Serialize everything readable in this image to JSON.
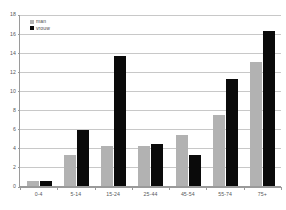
{
  "chart_data": {
    "type": "bar",
    "title": "",
    "subtitle": "",
    "xlabel": "",
    "ylabel": "",
    "categories": [
      "0-4",
      "5-14",
      "15-24",
      "25-44",
      "45-54",
      "55-74",
      "75+"
    ],
    "series": [
      {
        "name": "man",
        "color": "#b2b2b2",
        "values": [
          0.5,
          3.2,
          4.2,
          4.2,
          5.3,
          7.4,
          13.0
        ]
      },
      {
        "name": "vrouw",
        "color": "#0a0a0a",
        "values": [
          0.5,
          5.9,
          13.6,
          4.4,
          3.2,
          11.2,
          16.2
        ]
      }
    ],
    "ylim": [
      0,
      18
    ],
    "yticks": [
      0,
      2,
      4,
      6,
      8,
      10,
      12,
      14,
      16,
      18
    ],
    "ytick_labels": [
      "0",
      "2",
      "4",
      "6",
      "8",
      "10",
      "12",
      "14",
      "16",
      "18"
    ],
    "grid": true,
    "grid_axis": "y",
    "legend_position": "upper-left-inside",
    "annotations": []
  },
  "axes": {
    "y_axis_color": "#9a9a9a",
    "x_axis_color": "#9a9a9a",
    "gridline_color": "#c8c8c8",
    "tick_label_color": "#58595b"
  },
  "legend": {
    "entries": [
      {
        "label": "man",
        "color": "#b2b2b2"
      },
      {
        "label": "vrouw",
        "color": "#0a0a0a"
      }
    ]
  }
}
